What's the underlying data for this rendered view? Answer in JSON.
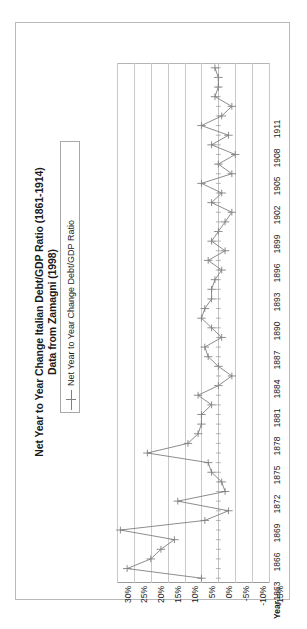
{
  "title": {
    "line1": "Net Year to Year Change Italian Debt/GDP Ratio (1861-1914)",
    "line2": "Data from Zamagni (1998)"
  },
  "legend": {
    "entry_label": "Net Year to Year Change Debt/GDP Ratio",
    "marker": "plus-line-marker"
  },
  "axes": {
    "category_axis_title": "Year",
    "value_tick_labels": [
      "30%",
      "25%",
      "20%",
      "15%",
      "10%",
      "5%",
      "0%",
      "-5%",
      "-10%",
      "-15%"
    ],
    "year_tick_labels": [
      "1863",
      "1866",
      "1869",
      "1872",
      "1875",
      "1878",
      "1881",
      "1884",
      "1887",
      "1890",
      "1893",
      "1896",
      "1899",
      "1902",
      "1905",
      "1908",
      "1911"
    ]
  },
  "colors": {
    "series_line": "#808080",
    "gridline": "#c9c9c9",
    "frame": "#b9b9b9",
    "text": "#1a1a1a",
    "background": "#ffffff"
  },
  "chart_data": {
    "type": "line",
    "title": "Net Year to Year Change Italian Debt/GDP Ratio (1861-1914) Data from Zamagni (1998)",
    "subtitle": "Data from Zamagni (1998)",
    "orientation": "horizontal-bar-style (categories on vertical axis, values on horizontal axis)",
    "xlabel": "",
    "ylabel": "Year",
    "xlim": [
      -15,
      30
    ],
    "xtick_step": 5,
    "grid": true,
    "legend_position": "top-left",
    "series": [
      {
        "name": "Net Year to Year Change Debt/GDP Ratio",
        "marker": "plus",
        "color": "#808080",
        "categories": [
          1861,
          1862,
          1863,
          1864,
          1865,
          1866,
          1867,
          1868,
          1869,
          1870,
          1871,
          1872,
          1873,
          1874,
          1875,
          1876,
          1877,
          1878,
          1879,
          1880,
          1881,
          1882,
          1883,
          1884,
          1885,
          1886,
          1887,
          1888,
          1889,
          1890,
          1891,
          1892,
          1893,
          1894,
          1895,
          1896,
          1897,
          1898,
          1899,
          1900,
          1901,
          1902,
          1903,
          1904,
          1905,
          1906,
          1907,
          1908,
          1909,
          1910,
          1911,
          1912,
          1913,
          1914
        ],
        "values": [
          5.0,
          27.0,
          20.0,
          17.0,
          13.0,
          29.0,
          4.0,
          -3.0,
          12.0,
          -2.0,
          -1.0,
          2.0,
          3.0,
          21.0,
          9.0,
          6.0,
          5.0,
          5.0,
          2.0,
          6.0,
          0.0,
          -4.0,
          0.0,
          3.0,
          4.0,
          -1.0,
          2.0,
          5.0,
          4.0,
          2.0,
          2.0,
          1.0,
          -1.0,
          3.0,
          -2.0,
          2.0,
          0.0,
          -2.0,
          -4.0,
          2.0,
          -1.0,
          5.0,
          -4.0,
          0.0,
          -5.0,
          2.0,
          -3.0,
          5.0,
          -1.0,
          -4.0,
          1.0,
          0.0,
          0.0,
          1.0
        ]
      }
    ]
  }
}
